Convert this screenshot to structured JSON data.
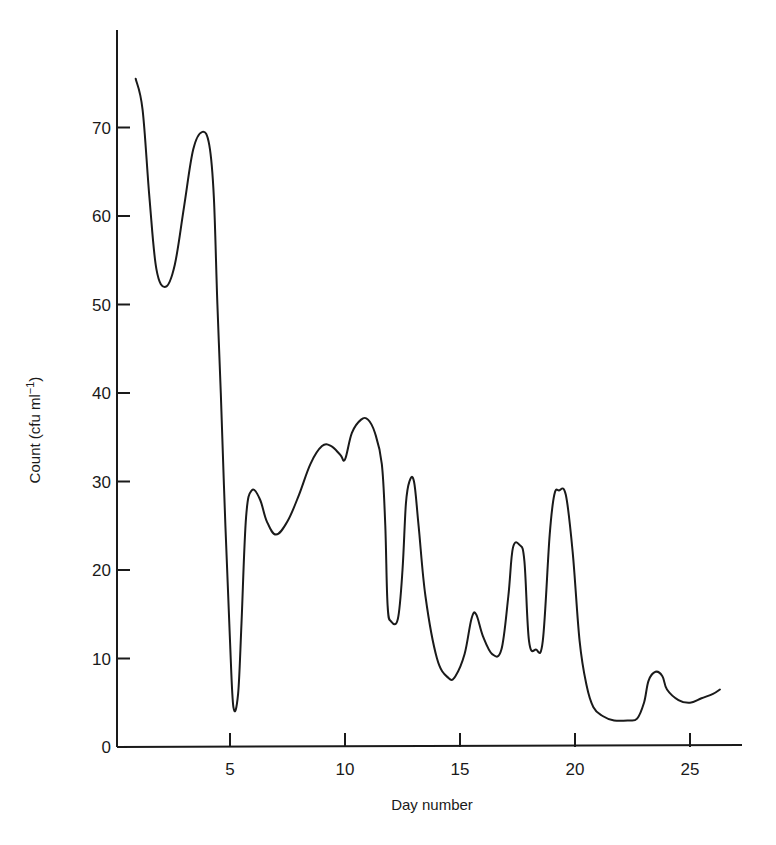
{
  "chart_data": {
    "type": "line",
    "title": "",
    "xlabel": "Day number",
    "ylabel": "Count (cfu ml⁻¹)",
    "xlim": [
      0,
      27.5
    ],
    "ylim": [
      0,
      80
    ],
    "grid": false,
    "legend": "none",
    "x_ticks": [
      5,
      10,
      15,
      20,
      25
    ],
    "y_ticks": [
      0,
      10,
      20,
      30,
      40,
      50,
      60,
      70
    ],
    "series": [
      {
        "name": "Count",
        "x": [
          0.9,
          1.2,
          1.5,
          1.8,
          2.2,
          2.6,
          3.0,
          3.4,
          3.8,
          4.1,
          4.3,
          4.45,
          4.6,
          4.8,
          5.0,
          5.15,
          5.35,
          5.5,
          5.7,
          5.95,
          6.3,
          6.6,
          7.0,
          7.5,
          8.0,
          8.5,
          9.0,
          9.4,
          9.8,
          10.0,
          10.3,
          10.7,
          11.0,
          11.3,
          11.6,
          11.75,
          11.85,
          12.0,
          12.3,
          12.5,
          12.65,
          12.8,
          13.0,
          13.2,
          13.5,
          14.0,
          14.5,
          14.8,
          15.2,
          15.5,
          15.7,
          16.0,
          16.4,
          16.8,
          17.1,
          17.3,
          17.6,
          17.8,
          18.0,
          18.3,
          18.6,
          18.9,
          19.1,
          19.3,
          19.6,
          19.9,
          20.2,
          20.5,
          20.8,
          21.2,
          21.7,
          22.3,
          22.7,
          23.0,
          23.2,
          23.5,
          23.8,
          24.0,
          24.5,
          25.0,
          25.5,
          26.0,
          26.3
        ],
        "values": [
          75.5,
          72.0,
          62.0,
          54.0,
          52.0,
          54.5,
          61.0,
          67.5,
          69.5,
          68.0,
          62.0,
          50.0,
          40.0,
          25.0,
          12.0,
          4.5,
          6.0,
          14.0,
          26.0,
          29.0,
          28.0,
          25.5,
          24.0,
          25.5,
          28.5,
          32.0,
          34.0,
          34.0,
          33.0,
          32.5,
          35.5,
          37.0,
          37.0,
          35.5,
          32.0,
          25.0,
          16.0,
          14.2,
          14.5,
          20.0,
          27.5,
          30.0,
          30.0,
          25.0,
          17.0,
          10.0,
          7.8,
          8.0,
          10.5,
          14.5,
          15.0,
          12.5,
          10.5,
          11.0,
          17.0,
          22.5,
          22.8,
          21.0,
          12.0,
          11.0,
          12.0,
          24.0,
          28.5,
          29.0,
          28.5,
          22.0,
          12.0,
          7.0,
          4.5,
          3.5,
          3.0,
          3.0,
          3.2,
          5.0,
          7.5,
          8.5,
          8.0,
          6.5,
          5.3,
          5.0,
          5.5,
          6.0,
          6.5
        ]
      }
    ]
  },
  "axes": {
    "xlabel": "Day number",
    "ylabel_main": "Count (cfu ml",
    "ylabel_sup": "−1",
    "ylabel_close": ")"
  },
  "colors": {
    "line": "#1a1a1a",
    "axis": "#1a1a1a",
    "background": "#ffffff"
  }
}
